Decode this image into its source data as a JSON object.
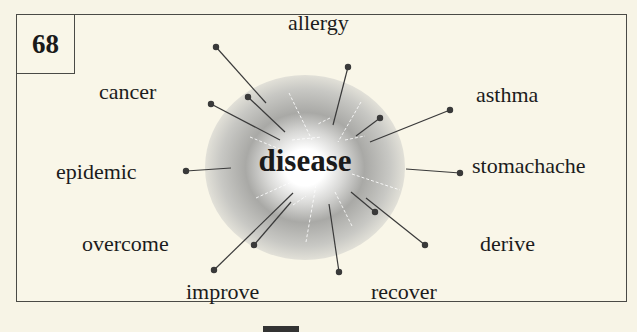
{
  "card": {
    "number": "68",
    "center_word": "disease",
    "related_words": [
      {
        "id": "allergy",
        "label": "allergy"
      },
      {
        "id": "cancer",
        "label": "cancer"
      },
      {
        "id": "asthma",
        "label": "asthma"
      },
      {
        "id": "epidemic",
        "label": "epidemic"
      },
      {
        "id": "stomachache",
        "label": "stomachache"
      },
      {
        "id": "overcome",
        "label": "overcome"
      },
      {
        "id": "derive",
        "label": "derive"
      },
      {
        "id": "improve",
        "label": "improve"
      },
      {
        "id": "recover",
        "label": "recover"
      }
    ]
  },
  "colors": {
    "background": "#f7f4e6",
    "border": "#4a4a46",
    "text": "#1c1c1c",
    "line": "#3a3a3a"
  }
}
